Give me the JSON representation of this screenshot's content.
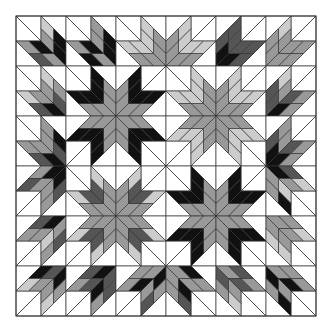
{
  "grid": {
    "origin_x": 16,
    "origin_y": 16,
    "block_size": 50,
    "cols": 6,
    "rows": 6
  },
  "palette": {
    "K": "#111111",
    "D": "#555555",
    "M": "#999999",
    "L": "#cccccc",
    "W": "#ffffff",
    "line": "#333333"
  },
  "blocks": [
    {
      "c": 0,
      "r": 0,
      "p": "br",
      "s": "KMKL MKDM"
    },
    {
      "c": 1,
      "r": 0,
      "p": "br",
      "s": "KMKM MKKM"
    },
    {
      "c": 2,
      "r": 0,
      "p": "br",
      "s": "MLML MLML"
    },
    {
      "c": 3,
      "r": 0,
      "p": "bl",
      "s": "MLML MLML"
    },
    {
      "c": 4,
      "r": 0,
      "p": "bl",
      "s": "KDDD KDDD"
    },
    {
      "c": 5,
      "r": 0,
      "p": "bl",
      "s": "MMML MMMM"
    },
    {
      "c": 0,
      "r": 1,
      "p": "br",
      "s": "DMML KMDL"
    },
    {
      "c": 1,
      "r": 1,
      "p": "br",
      "s": "MKMK MKMK"
    },
    {
      "c": 2,
      "r": 1,
      "p": "bl",
      "s": "MKMK MKMK"
    },
    {
      "c": 3,
      "r": 1,
      "p": "br",
      "s": "MLML MLML"
    },
    {
      "c": 4,
      "r": 1,
      "p": "bl",
      "s": "MLML MLML"
    },
    {
      "c": 5,
      "r": 1,
      "p": "bl",
      "s": "DMDL KDMM"
    },
    {
      "c": 0,
      "r": 2,
      "p": "br",
      "s": "DMKM KMDM"
    },
    {
      "c": 1,
      "r": 2,
      "p": "tr",
      "s": "MKMK MKMK"
    },
    {
      "c": 2,
      "r": 2,
      "p": "tl",
      "s": "MKMK MKMK"
    },
    {
      "c": 3,
      "r": 2,
      "p": "tr",
      "s": "MLML MLML"
    },
    {
      "c": 4,
      "r": 2,
      "p": "tl",
      "s": "MLML MLML"
    },
    {
      "c": 5,
      "r": 2,
      "p": "bl",
      "s": "KMDM KDMM"
    },
    {
      "c": 0,
      "r": 3,
      "p": "tr",
      "s": "KMDM KMMD"
    },
    {
      "c": 1,
      "r": 3,
      "p": "br",
      "s": "MDML MDML"
    },
    {
      "c": 2,
      "r": 3,
      "p": "bl",
      "s": "MDML MDML"
    },
    {
      "c": 3,
      "r": 3,
      "p": "br",
      "s": "MKMK MKMK"
    },
    {
      "c": 4,
      "r": 3,
      "p": "bl",
      "s": "MKMK MKMK"
    },
    {
      "c": 5,
      "r": 3,
      "p": "tl",
      "s": "MLMK KMDL"
    },
    {
      "c": 0,
      "r": 4,
      "p": "tr",
      "s": "MLDM KMDM"
    },
    {
      "c": 1,
      "r": 4,
      "p": "tr",
      "s": "MDML MDML"
    },
    {
      "c": 2,
      "r": 4,
      "p": "tl",
      "s": "MDML MDML"
    },
    {
      "c": 3,
      "r": 4,
      "p": "tr",
      "s": "MKMK MKMK"
    },
    {
      "c": 4,
      "r": 4,
      "p": "tl",
      "s": "MKMK MKMK"
    },
    {
      "c": 5,
      "r": 4,
      "p": "tl",
      "s": "MMLL MMML"
    },
    {
      "c": 0,
      "r": 5,
      "p": "tr",
      "s": "KMML DMKL"
    },
    {
      "c": 1,
      "r": 5,
      "p": "tr",
      "s": "DKDM KDDM"
    },
    {
      "c": 2,
      "r": 5,
      "p": "tr",
      "s": "KMMD MKMM"
    },
    {
      "c": 3,
      "r": 5,
      "p": "tl",
      "s": "MKMD MMKM"
    },
    {
      "c": 4,
      "r": 5,
      "p": "tl",
      "s": "DMML MDDM"
    },
    {
      "c": 5,
      "r": 5,
      "p": "tl",
      "s": "KMMK MKMM"
    }
  ]
}
